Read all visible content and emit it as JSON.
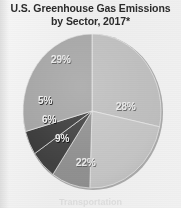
{
  "figure": {
    "title_line1": "U.S. Greenhouse Gas Emissions",
    "title_line2": "by Sector, 2017*",
    "background_color": "#f1f1f1",
    "legend_partial_text": "Transportation"
  },
  "chart_data": {
    "type": "pie",
    "title": "U.S. Greenhouse Gas Emissions by Sector, 2017*",
    "categories": [
      "28%",
      "22%",
      "9%",
      "6%",
      "5%",
      "29%"
    ],
    "values": [
      28,
      22,
      9,
      6,
      5,
      29
    ],
    "labels": [
      "28%",
      "22%",
      "9%",
      "6%",
      "5%",
      "29%"
    ],
    "colors": [
      "#bdbdbd",
      "#c4c4c4",
      "#8e8e8e",
      "#3d3d3d",
      "#373737",
      "#a3a3a3"
    ],
    "units": "percent",
    "start_angle_deg": 0,
    "direction": "clockwise",
    "legend": "cut-off-at-bottom",
    "grid": false,
    "xlabel": "",
    "ylabel": ""
  },
  "slices": [
    {
      "label": "28%",
      "value": 28,
      "color": "#bdbdbd"
    },
    {
      "label": "22%",
      "value": 22,
      "color": "#c4c4c4"
    },
    {
      "label": "9%",
      "value": 9,
      "color": "#8e8e8e"
    },
    {
      "label": "6%",
      "value": 6,
      "color": "#3d3d3d"
    },
    {
      "label": "5%",
      "value": 5,
      "color": "#373737"
    },
    {
      "label": "29%",
      "value": 29,
      "color": "#a3a3a3"
    }
  ]
}
